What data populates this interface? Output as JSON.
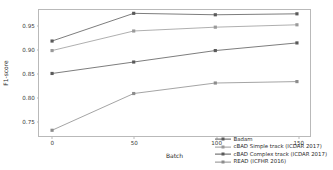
{
  "chart_data": {
    "type": "line",
    "title": "",
    "xlabel": "Batch",
    "ylabel": "F1-score",
    "x": [
      0,
      50,
      100,
      150
    ],
    "xticks": [
      "0",
      "50",
      "100",
      "150"
    ],
    "yticks": [
      "0.75",
      "0.80",
      "0.85",
      "0.90",
      "0.95"
    ],
    "ytick_values": [
      0.75,
      0.8,
      0.85,
      0.9,
      0.95
    ],
    "xlim": [
      -8,
      158
    ],
    "ylim": [
      0.718,
      0.982
    ],
    "grid": false,
    "legend_position": "lower right",
    "series": [
      {
        "name": "Badam",
        "values": [
          0.917,
          0.975,
          0.972,
          0.974
        ],
        "color": "#5a5a5a",
        "marker": "square"
      },
      {
        "name": "cBAD Simple track (ICDAR 2017)",
        "values": [
          0.897,
          0.938,
          0.946,
          0.951
        ],
        "color": "#9a9a9a",
        "marker": "square"
      },
      {
        "name": "cBAD Complex track (ICDAR 2017)",
        "values": [
          0.849,
          0.873,
          0.897,
          0.913
        ],
        "color": "#5a5a5a",
        "marker": "square"
      },
      {
        "name": "READ (ICFHR 2016)",
        "values": [
          0.73,
          0.807,
          0.829,
          0.832
        ],
        "color": "#8c8c8c",
        "marker": "square"
      }
    ]
  }
}
